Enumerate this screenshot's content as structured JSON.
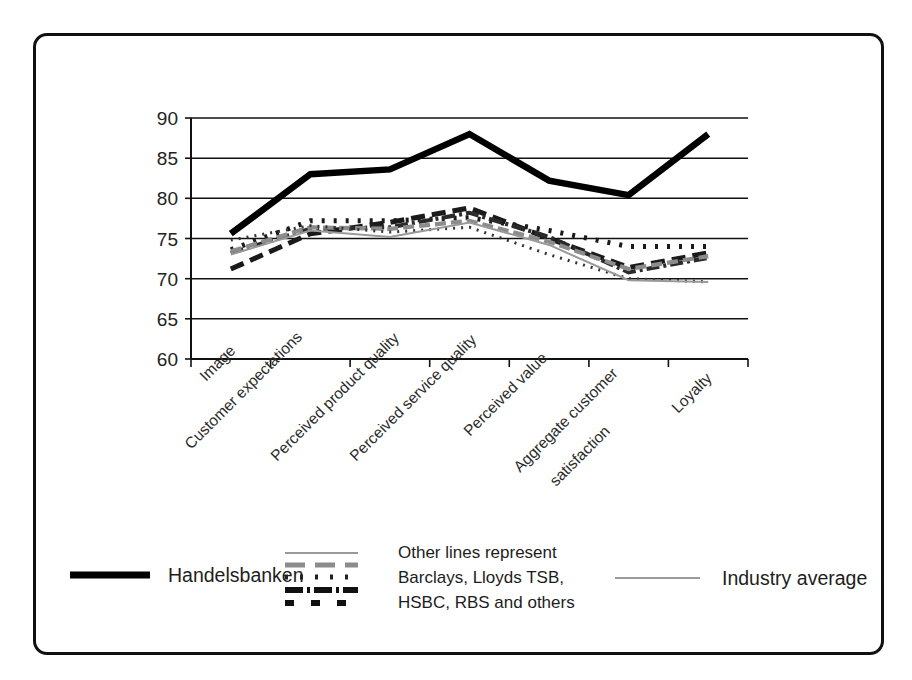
{
  "chart_data": {
    "type": "line",
    "title": "",
    "xlabel": "",
    "ylabel": "",
    "ylim": [
      60,
      90
    ],
    "yticks": [
      60,
      65,
      70,
      75,
      80,
      85,
      90
    ],
    "grid": true,
    "legend_position": "bottom",
    "categories": [
      "Image",
      "Customer expectations",
      "Perceived product quality",
      "Perceived service quality",
      "Perceived value",
      "Aggregate customer satisfaction",
      "Loyalty"
    ],
    "series": [
      {
        "name": "Handelsbanken",
        "style": "solid-heavy-black",
        "color": "#000000",
        "values": [
          75.6,
          83.0,
          83.6,
          88.0,
          82.2,
          80.4,
          88.0
        ]
      },
      {
        "name": "Other bank A",
        "style": "dashed-heavy-black",
        "color": "#1a1a1a",
        "values": [
          71.2,
          75.6,
          77.0,
          78.8,
          75.0,
          71.4,
          73.2
        ]
      },
      {
        "name": "Other bank B",
        "style": "dotted-heavy-black",
        "color": "#1a1a1a",
        "values": [
          73.6,
          77.2,
          77.2,
          77.6,
          76.0,
          74.0,
          74.0
        ]
      },
      {
        "name": "Other bank C",
        "style": "dash-dot-black",
        "color": "#2a2a2a",
        "values": [
          73.2,
          76.2,
          76.4,
          78.2,
          75.2,
          70.8,
          72.6
        ]
      },
      {
        "name": "Other bank D",
        "style": "dashed-gray",
        "color": "#8c8c8c",
        "values": [
          73.4,
          76.4,
          76.2,
          77.2,
          74.6,
          71.2,
          72.8
        ]
      },
      {
        "name": "Other bank E",
        "style": "dotted-fine-black",
        "color": "#333333",
        "values": [
          74.8,
          76.6,
          75.8,
          76.4,
          73.0,
          70.0,
          69.6
        ]
      },
      {
        "name": "Industry average",
        "style": "thin-gray",
        "color": "#9a9a9a",
        "values": [
          73.0,
          76.0,
          75.2,
          77.0,
          74.2,
          69.8,
          69.6
        ]
      }
    ]
  },
  "axis": {
    "y_tick_labels": [
      "90",
      "85",
      "80",
      "75",
      "70",
      "65",
      "60"
    ],
    "x_tick_labels": [
      "Image",
      "Customer expectations",
      "Perceived product quality",
      "Perceived service quality",
      "Perceived value",
      "Aggregate customer",
      "satisfaction",
      "Loyalty"
    ]
  },
  "legend": {
    "handelsbanken_label": "Handelsbanken",
    "other_lines_line1": "Other lines represent",
    "other_lines_line2": "Barclays, Lloyds TSB,",
    "other_lines_line3": "HSBC, RBS and others",
    "industry_average_label": "Industry average"
  }
}
